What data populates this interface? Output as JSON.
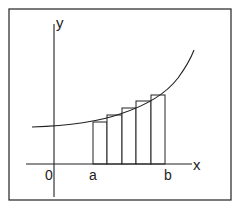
{
  "diagram": {
    "title": "",
    "type": "lower Riemann sum (left rectangles under increasing curve)",
    "labels": {
      "y_axis": "y",
      "x_axis": "x",
      "origin": "0",
      "a": "a",
      "b": "b"
    },
    "colors": {
      "stroke": "#222222",
      "background": "#ffffff",
      "bar_fill": "#ffffff"
    },
    "frame": {
      "x": 9,
      "y": 9,
      "w": 222,
      "h": 191
    },
    "axes": {
      "x_axis": {
        "x1": 26,
        "x2": 192,
        "y": 164
      },
      "y_axis": {
        "x": 54,
        "y1": 24,
        "y2": 197
      }
    },
    "curve_path": "M32,127 C60,126 95,123 120,114 C145,106 165,95 178,78 C186,67 191,58 194,50",
    "rectangles": [
      {
        "x": 93,
        "top": 122,
        "width": 14
      },
      {
        "x": 107,
        "top": 115,
        "width": 15
      },
      {
        "x": 122,
        "top": 108,
        "width": 14
      },
      {
        "x": 136,
        "top": 101,
        "width": 15
      },
      {
        "x": 151,
        "top": 95,
        "width": 14
      }
    ],
    "label_positions": {
      "y_axis": {
        "x": 56,
        "y": 28
      },
      "x_axis": {
        "x": 193,
        "y": 170
      },
      "origin": {
        "x": 45,
        "y": 180
      },
      "a": {
        "x": 89,
        "y": 180
      },
      "b": {
        "x": 164,
        "y": 180
      }
    }
  }
}
